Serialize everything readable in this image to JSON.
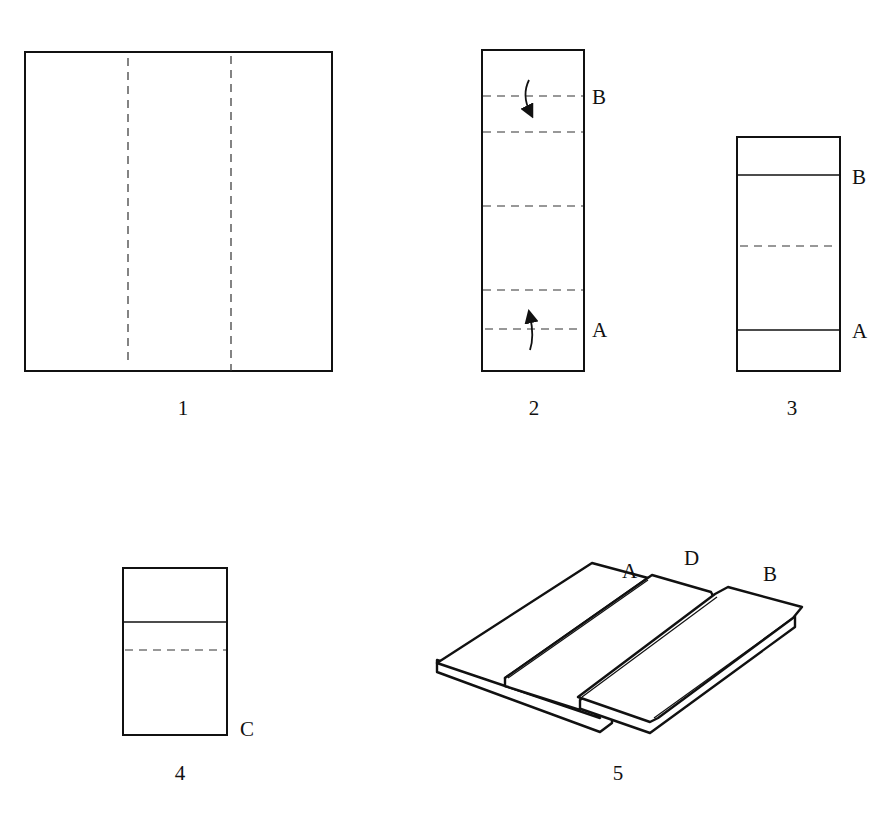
{
  "figures": [
    {
      "number": "1",
      "labels": []
    },
    {
      "number": "2",
      "labels": [
        "B",
        "A"
      ]
    },
    {
      "number": "3",
      "labels": [
        "B",
        "A"
      ]
    },
    {
      "number": "4",
      "labels": [
        "C"
      ]
    },
    {
      "number": "5",
      "labels": [
        "A",
        "D",
        "B"
      ]
    }
  ],
  "colors": {
    "ink": "#111111",
    "paper": "#ffffff"
  }
}
